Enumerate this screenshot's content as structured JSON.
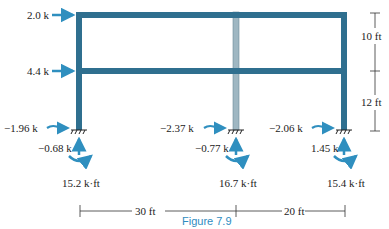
{
  "figure": {
    "caption": "Figure 7.9",
    "colors": {
      "frame": "#2f6f8f",
      "interior_column": "#9fb7c2",
      "arrow": "#2f8fbf",
      "dim": "#333333"
    }
  },
  "applied_loads": [
    {
      "label": "2.0 k",
      "level": "roof"
    },
    {
      "label": "4.4 k",
      "level": "second floor"
    }
  ],
  "supports": [
    {
      "name": "left",
      "horizontal": "−1.96 k",
      "vertical": "−0.68 k",
      "moment": "15.2 k·ft"
    },
    {
      "name": "middle",
      "horizontal": "−2.37 k",
      "vertical": "−0.77 k",
      "moment": "16.7 k·ft"
    },
    {
      "name": "right",
      "horizontal": "−2.06 k",
      "vertical": "1.45 k",
      "moment": "15.4 k·ft"
    }
  ],
  "dimensions": {
    "vertical": [
      "10 ft",
      "12 ft"
    ],
    "horizontal": [
      "30 ft",
      "20 ft"
    ]
  }
}
